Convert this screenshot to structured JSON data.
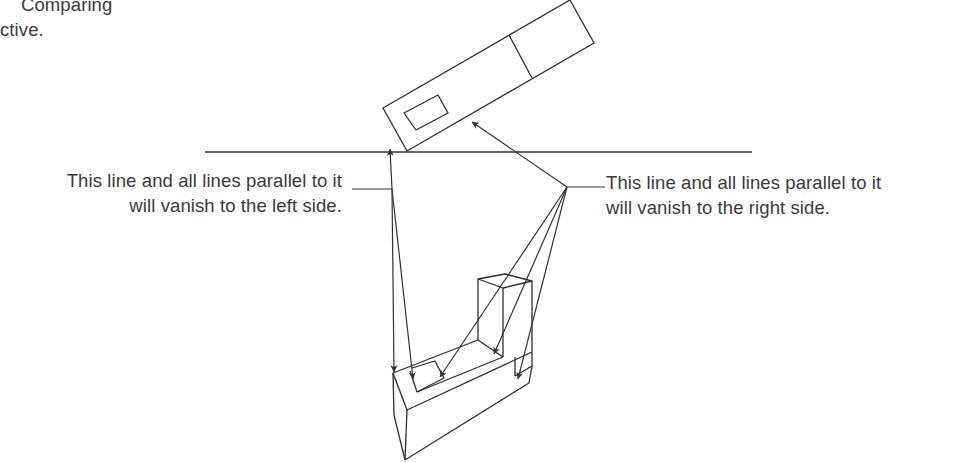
{
  "caption_fragment": {
    "line1": "Comparing",
    "line2": "ctive."
  },
  "annotations": {
    "left": {
      "line1": "This line and all lines parallel to it",
      "line2": "will vanish to the left side."
    },
    "right": {
      "line1": "This line and all lines parallel to it",
      "line2": "will vanish to the right side."
    }
  },
  "diagram": {
    "elements": [
      "horizon-line",
      "plan-view-rectangle",
      "perspective-block",
      "vanishing-direction-arrows"
    ],
    "line_color": "#333333",
    "text_color": "#3a3a3a"
  }
}
